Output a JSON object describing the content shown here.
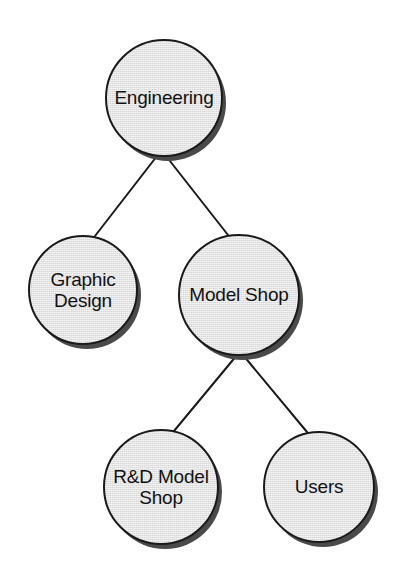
{
  "diagram": {
    "type": "hierarchy-tree",
    "style": {
      "node_shape": "circle",
      "node_fill": "#d7d7d7",
      "node_outline": "#1a1a1a",
      "node_shadow": "#4a4a4a",
      "edge_color": "#1a1a1a",
      "background": "#ffffff",
      "label_color": "#121212"
    },
    "nodes": [
      {
        "id": "engineering",
        "label": "Engineering",
        "cx": 164,
        "cy": 98,
        "r": 59,
        "level": 0
      },
      {
        "id": "graphic-design",
        "label": "Graphic\nDesign",
        "cx": 83,
        "cy": 290,
        "r": 55,
        "level": 1
      },
      {
        "id": "model-shop",
        "label": "Model Shop",
        "cx": 239,
        "cy": 295,
        "r": 61,
        "level": 1
      },
      {
        "id": "rd-model-shop",
        "label": "R&D Model\nShop",
        "cx": 161,
        "cy": 487,
        "r": 58,
        "level": 2
      },
      {
        "id": "users",
        "label": "Users",
        "cx": 319,
        "cy": 487,
        "r": 56,
        "level": 2
      }
    ],
    "edges": [
      {
        "id": "edge-engineering-graphic-design",
        "from": "engineering",
        "to": "graphic-design",
        "x1": 157,
        "y1": 156,
        "x2": 95,
        "y2": 236
      },
      {
        "id": "edge-engineering-model-shop",
        "from": "engineering",
        "to": "model-shop",
        "x1": 166,
        "y1": 156,
        "x2": 228,
        "y2": 235
      },
      {
        "id": "edge-model-shop-rd-model-shop",
        "from": "model-shop",
        "to": "rd-model-shop",
        "x1": 237,
        "y1": 355,
        "x2": 174,
        "y2": 431
      },
      {
        "id": "edge-model-shop-users",
        "from": "model-shop",
        "to": "users",
        "x1": 243,
        "y1": 355,
        "x2": 307,
        "y2": 432
      }
    ]
  }
}
